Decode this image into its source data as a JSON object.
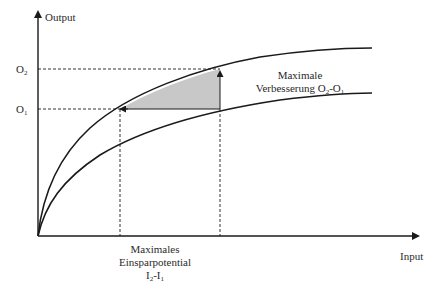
{
  "diagram": {
    "type": "production-function-comparison",
    "axes": {
      "y_label": "Output",
      "x_label": "Input"
    },
    "y_ticks": [
      {
        "base": "O",
        "sub": "2"
      },
      {
        "base": "O",
        "sub": "1"
      }
    ],
    "curves": [
      {
        "name": "upper-production-curve",
        "description": "efficient frontier"
      },
      {
        "name": "lower-production-curve",
        "description": "actual production"
      }
    ],
    "annotations": {
      "improvement": {
        "line1": "Maximale",
        "line2_text": "Verbesserung O",
        "line2_sub1": "2",
        "line2_mid": "-O",
        "line2_sub2": "1"
      },
      "savings": {
        "line1": "Maximales",
        "line2": "Einsparpotential",
        "line3_a": "I",
        "line3_sub1": "2",
        "line3_mid": "-I",
        "line3_sub2": "1"
      }
    },
    "colors": {
      "line": "#1a1a1a",
      "shaded_area": "#c8c8c8",
      "background": "#ffffff"
    }
  }
}
